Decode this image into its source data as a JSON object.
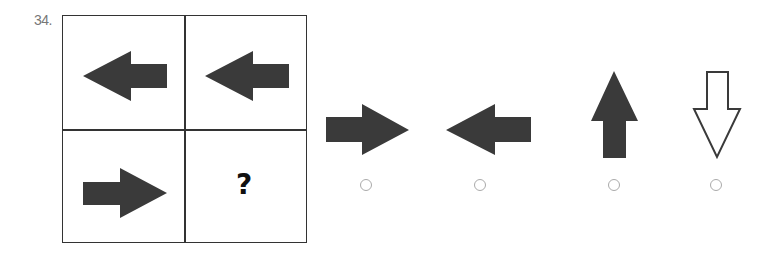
{
  "question": {
    "number": "34.",
    "matrix": {
      "rows": 2,
      "cols": 2,
      "cells": [
        {
          "position": "top-left",
          "content": "arrow-left",
          "fill": "solid"
        },
        {
          "position": "top-right",
          "content": "arrow-left",
          "fill": "solid"
        },
        {
          "position": "bottom-left",
          "content": "arrow-right",
          "fill": "solid"
        },
        {
          "position": "bottom-right",
          "content": "question-mark",
          "text": "?"
        }
      ]
    },
    "options": [
      {
        "index": 1,
        "shape": "arrow-right",
        "fill": "solid",
        "selected": false
      },
      {
        "index": 2,
        "shape": "arrow-left",
        "fill": "solid",
        "selected": false
      },
      {
        "index": 3,
        "shape": "arrow-up",
        "fill": "solid",
        "selected": false
      },
      {
        "index": 4,
        "shape": "arrow-down",
        "fill": "outline",
        "selected": false
      }
    ]
  },
  "colors": {
    "arrow_fill": "#3a3a3a",
    "grid_border": "#333333",
    "radio_border": "#aaaaaa",
    "number_text": "#777777"
  }
}
